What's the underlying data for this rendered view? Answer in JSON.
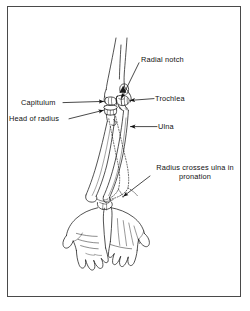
{
  "figure": {
    "domain": "anatomical-illustration",
    "border_color": "#4a4a4a",
    "ink_color": "#1a1a1a",
    "background_color": "#ffffff"
  },
  "labels": [
    {
      "id": "radial-notch",
      "text": "Radial notch",
      "x": 141,
      "y": 59,
      "leader": "from label left edge down-left to the radial notch on the proximal ulna"
    },
    {
      "id": "trochlea",
      "text": "Trochlea",
      "x": 155,
      "y": 95,
      "leader": "horizontal line left from label to the trochlea of the humerus"
    },
    {
      "id": "capitulum",
      "text": "Capitulum",
      "x": 21,
      "y": 99,
      "leader": "horizontal line right from label with arrowhead at the capitulum"
    },
    {
      "id": "head-of-radius",
      "text": "Head of radius",
      "x": 9,
      "y": 115,
      "leader": "line right and slightly up from label with arrowhead at the radial head"
    },
    {
      "id": "ulna",
      "text": "Ulna",
      "x": 158,
      "y": 123,
      "leader": "horizontal line left from label with arrowhead on the ulnar shaft"
    },
    {
      "id": "radius-crosses-ulna",
      "text": "Radius crosses ulna in pronation",
      "line1": "Radius crosses ulna",
      "line2": "in pronation",
      "x": 152,
      "y": 166,
      "leader": "diagonal line down-left from label with arrowhead at the crossing point of the bones"
    }
  ],
  "structures": [
    {
      "id": "humerus",
      "name": "Humerus shaft and distal end"
    },
    {
      "id": "trochlea",
      "name": "Trochlea"
    },
    {
      "id": "capitulum",
      "name": "Capitulum"
    },
    {
      "id": "radial-notch",
      "name": "Radial notch of ulna"
    },
    {
      "id": "radial-head",
      "name": "Head of radius"
    },
    {
      "id": "ulna-shaft",
      "name": "Ulna"
    },
    {
      "id": "radius-shaft",
      "name": "Radius (supinated position, solid)"
    },
    {
      "id": "radius-pronated",
      "name": "Radius in pronation (dotted outline crossing ulna)"
    },
    {
      "id": "hand-left",
      "name": "Hand, palmar view"
    },
    {
      "id": "hand-right",
      "name": "Hand, dorsal view (pronated)"
    }
  ]
}
